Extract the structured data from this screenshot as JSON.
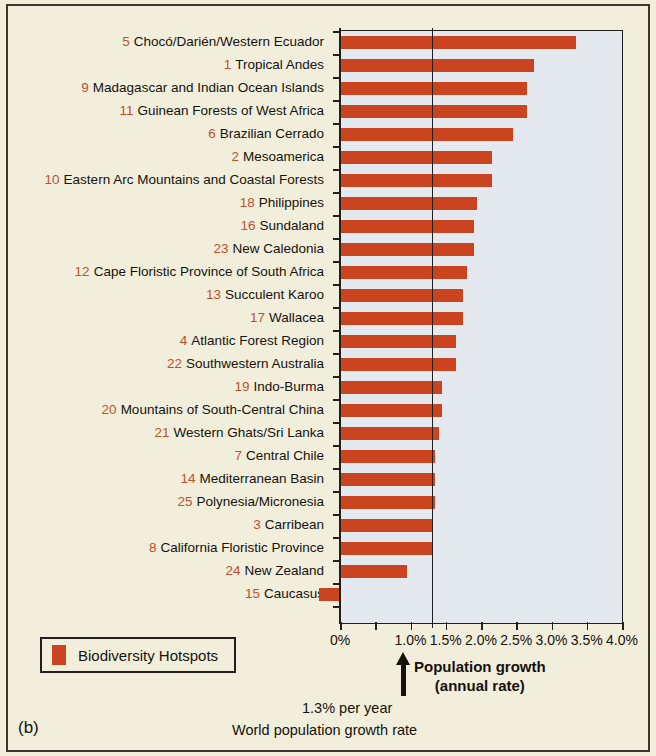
{
  "panel": {
    "label": "(b)"
  },
  "legend": {
    "label": "Biodiversity Hotspots",
    "swatch_color": "#c9441f"
  },
  "annotations": {
    "axis_caption_line1": "Population growth",
    "axis_caption_line2": "(annual rate)",
    "reference_value": "1.3% per year",
    "reference_caption": "World population growth rate"
  },
  "colors": {
    "bar": "#c9441f",
    "number": "#c1512a",
    "plot_background": "#e3e9ef",
    "page_background": "#f2eedc",
    "axis": "#22201c"
  },
  "chart_data": {
    "type": "bar",
    "orientation": "horizontal",
    "title": "",
    "xlabel": "Population growth (annual rate)",
    "ylabel": "",
    "xlim": [
      0,
      4.0
    ],
    "xticks": [
      0,
      0.5,
      1.0,
      1.5,
      2.0,
      2.5,
      3.0,
      3.5,
      4.0
    ],
    "xtick_labels": [
      "0%",
      "",
      "1.0%",
      "1.5%",
      "2.0%",
      "2.5%",
      "3.0%",
      "3.5%",
      "4.0%"
    ],
    "grid": false,
    "legend_position": "below-left",
    "reference_line": {
      "value": 1.3,
      "label": "1.3% per year",
      "caption": "World population growth rate"
    },
    "series_name": "Biodiversity Hotspots",
    "units": "percent per year",
    "categories": [
      {
        "rank": "5",
        "name": "Chocó/Darién/Western Ecuador"
      },
      {
        "rank": "1",
        "name": "Tropical Andes"
      },
      {
        "rank": "9",
        "name": "Madagascar and Indian Ocean Islands"
      },
      {
        "rank": "11",
        "name": "Guinean Forests of West Africa"
      },
      {
        "rank": "6",
        "name": "Brazilian Cerrado"
      },
      {
        "rank": "2",
        "name": "Mesoamerica"
      },
      {
        "rank": "10",
        "name": "Eastern Arc Mountains and Coastal Forests"
      },
      {
        "rank": "18",
        "name": "Philippines"
      },
      {
        "rank": "16",
        "name": "Sundaland"
      },
      {
        "rank": "23",
        "name": "New Caledonia"
      },
      {
        "rank": "12",
        "name": "Cape Floristic Province of South Africa"
      },
      {
        "rank": "13",
        "name": "Succulent Karoo"
      },
      {
        "rank": "17",
        "name": "Wallacea"
      },
      {
        "rank": "4",
        "name": "Atlantic Forest Region"
      },
      {
        "rank": "22",
        "name": "Southwestern Australia"
      },
      {
        "rank": "19",
        "name": "Indo-Burma"
      },
      {
        "rank": "20",
        "name": "Mountains of South-Central China"
      },
      {
        "rank": "21",
        "name": "Western Ghats/Sri Lanka"
      },
      {
        "rank": "7",
        "name": "Central Chile"
      },
      {
        "rank": "14",
        "name": "Mediterranean Basin"
      },
      {
        "rank": "25",
        "name": "Polynesia/Micronesia"
      },
      {
        "rank": "3",
        "name": "Carribean"
      },
      {
        "rank": "8",
        "name": "California Floristic Province"
      },
      {
        "rank": "24",
        "name": "New Zealand"
      },
      {
        "rank": "15",
        "name": "Caucasus"
      }
    ],
    "values": [
      3.35,
      2.75,
      2.65,
      2.65,
      2.45,
      2.15,
      2.15,
      1.95,
      1.9,
      1.9,
      1.8,
      1.75,
      1.75,
      1.65,
      1.65,
      1.45,
      1.45,
      1.4,
      1.35,
      1.35,
      1.35,
      1.3,
      1.3,
      0.95,
      -0.3
    ]
  }
}
